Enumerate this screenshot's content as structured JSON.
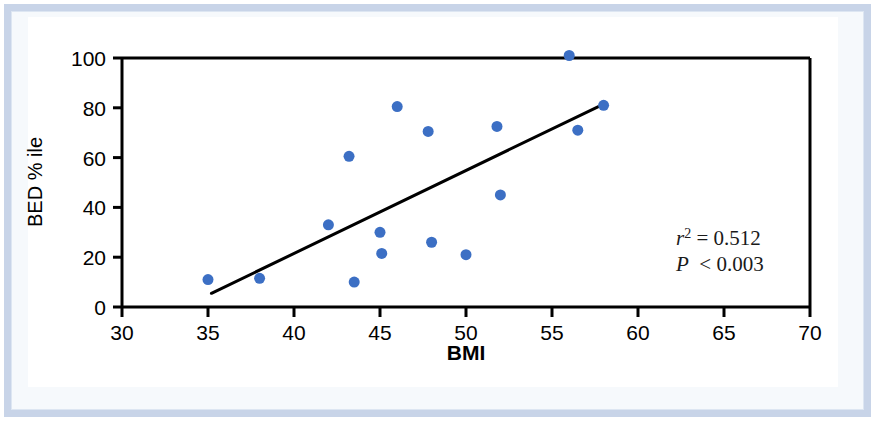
{
  "figure": {
    "background_color": "#ffffff",
    "frame_color": "#c8d4e8",
    "card_color": "#ffffff"
  },
  "chart_data": {
    "type": "scatter",
    "title": "",
    "subtitle": "",
    "xlabel": "BMI",
    "ylabel": "BED % ile",
    "xlim": [
      30,
      70
    ],
    "ylim": [
      0,
      100
    ],
    "xticks": [
      30,
      35,
      40,
      45,
      50,
      55,
      60,
      65,
      70
    ],
    "xtick_labels": [
      "30",
      "35",
      "40",
      "45",
      "50",
      "55",
      "60",
      "65",
      "70"
    ],
    "yticks": [
      0,
      20,
      40,
      60,
      80,
      100
    ],
    "ytick_labels": [
      "0",
      "20",
      "40",
      "60",
      "80",
      "100"
    ],
    "grid": false,
    "legend": null,
    "marker_color": "#3c6fc4",
    "marker_size": 11,
    "points": [
      {
        "x": 35.0,
        "y": 11.0
      },
      {
        "x": 38.0,
        "y": 11.5
      },
      {
        "x": 42.0,
        "y": 33.0
      },
      {
        "x": 43.2,
        "y": 60.5
      },
      {
        "x": 43.5,
        "y": 10.0
      },
      {
        "x": 45.0,
        "y": 30.0
      },
      {
        "x": 45.1,
        "y": 21.5
      },
      {
        "x": 46.0,
        "y": 80.5
      },
      {
        "x": 47.8,
        "y": 70.5
      },
      {
        "x": 48.0,
        "y": 26.0
      },
      {
        "x": 50.0,
        "y": 21.0
      },
      {
        "x": 51.8,
        "y": 72.5
      },
      {
        "x": 52.0,
        "y": 45.0
      },
      {
        "x": 56.0,
        "y": 101.0
      },
      {
        "x": 56.5,
        "y": 71.0
      },
      {
        "x": 58.0,
        "y": 81.0
      }
    ],
    "trendline": {
      "type": "linear",
      "color": "#000000",
      "width": 3,
      "x_start": 35.2,
      "y_start": 5.5,
      "x_end": 58.0,
      "y_end": 81.5
    },
    "annotations": {
      "r_squared_symbol": "r",
      "r_squared_exponent": "2",
      "r_squared_relation": "=",
      "r_squared_value": "0.512",
      "p_symbol": "P",
      "p_relation": "<",
      "p_value": "0.003"
    }
  }
}
